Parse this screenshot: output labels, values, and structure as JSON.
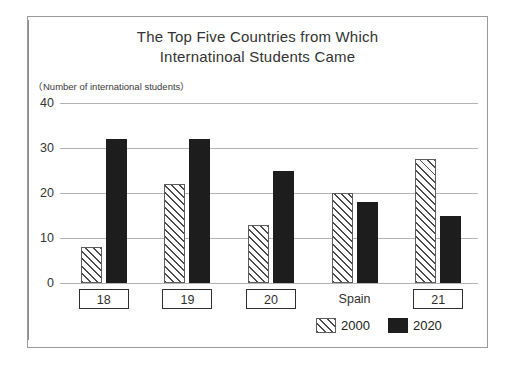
{
  "figure": {
    "title_line1": "The Top Five Countries from Which",
    "title_line2": "Internatinoal Students Came",
    "axis_caption": "（Number of international students）"
  },
  "legend": {
    "items": [
      {
        "label": "2000",
        "swatch": "hatched-swatch-icon",
        "color": "#ffffff"
      },
      {
        "label": "2020",
        "swatch": "solid-swatch-icon",
        "color": "#1d1d1d"
      }
    ]
  },
  "chart_data": {
    "type": "bar",
    "title": "The Top Five Countries from Which Internatinoal Students Came",
    "xlabel": "",
    "ylabel": "（Number of international students）",
    "ylim": [
      0,
      40
    ],
    "yticks": [
      0,
      10,
      20,
      30,
      40
    ],
    "grid": true,
    "legend_position": "bottom-right",
    "categories": [
      "18",
      "19",
      "20",
      "Spain",
      "21"
    ],
    "category_boxed": [
      true,
      true,
      true,
      false,
      true
    ],
    "series": [
      {
        "name": "2000",
        "values": [
          8,
          22,
          13,
          20,
          27.5
        ]
      },
      {
        "name": "2020",
        "values": [
          32,
          32,
          25,
          18,
          15
        ]
      }
    ]
  }
}
